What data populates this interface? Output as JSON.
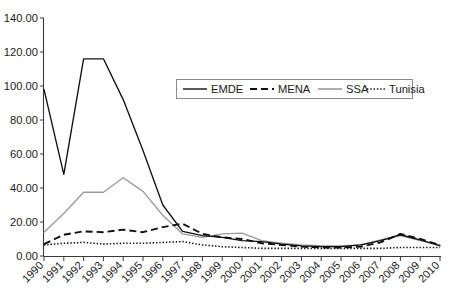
{
  "chart_data": {
    "type": "line",
    "title": "",
    "subtitle": "",
    "xlabel": "",
    "ylabel": "",
    "categories": [
      "1990",
      "1991",
      "1992",
      "1993",
      "1994",
      "1995",
      "1996",
      "1997",
      "1998",
      "1999",
      "2000",
      "2001",
      "2002",
      "2003",
      "2004",
      "2005",
      "2006",
      "2007",
      "2008",
      "2009",
      "2010"
    ],
    "ylim": [
      0,
      140
    ],
    "ytick_labels": [
      "0.00",
      "20.00",
      "40.00",
      "60.00",
      "80.00",
      "100.00",
      "120.00",
      "140.00"
    ],
    "ytick_values": [
      0,
      20,
      40,
      60,
      80,
      100,
      120,
      140
    ],
    "grid": false,
    "legend_position": "top-center-inside",
    "series": [
      {
        "name": "EMDE",
        "style": "solid-black",
        "color": "#111111",
        "values": [
          98.0,
          48.0,
          116.0,
          116.0,
          92.0,
          62.0,
          30.0,
          14.5,
          12.0,
          11.0,
          9.0,
          8.5,
          7.0,
          6.0,
          5.5,
          5.5,
          6.5,
          9.0,
          12.5,
          9.5,
          6.0
        ]
      },
      {
        "name": "MENA",
        "style": "dashed-black",
        "color": "#111111",
        "values": [
          7.0,
          12.5,
          14.5,
          14.0,
          15.5,
          14.0,
          17.0,
          19.0,
          13.0,
          11.0,
          10.0,
          7.5,
          6.5,
          5.5,
          5.0,
          5.0,
          5.5,
          8.0,
          13.0,
          10.0,
          6.5
        ]
      },
      {
        "name": "SSA",
        "style": "solid-gray",
        "color": "#9a9a9a",
        "values": [
          14.0,
          25.0,
          37.5,
          37.5,
          46.0,
          38.0,
          24.0,
          13.0,
          11.0,
          13.0,
          13.5,
          9.0,
          7.5,
          6.5,
          6.0,
          6.0,
          6.5,
          9.5,
          12.0,
          9.0,
          6.5
        ]
      },
      {
        "name": "Tunisia",
        "style": "dotted-black",
        "color": "#111111",
        "values": [
          6.5,
          7.5,
          8.0,
          7.0,
          7.5,
          7.5,
          8.0,
          8.5,
          6.5,
          5.5,
          5.0,
          4.5,
          4.5,
          4.5,
          4.5,
          4.5,
          4.5,
          4.5,
          5.0,
          5.0,
          5.0
        ]
      }
    ]
  },
  "legend": {
    "items": [
      {
        "label": "EMDE"
      },
      {
        "label": "MENA"
      },
      {
        "label": "SSA"
      },
      {
        "label": "Tunisia"
      }
    ]
  }
}
